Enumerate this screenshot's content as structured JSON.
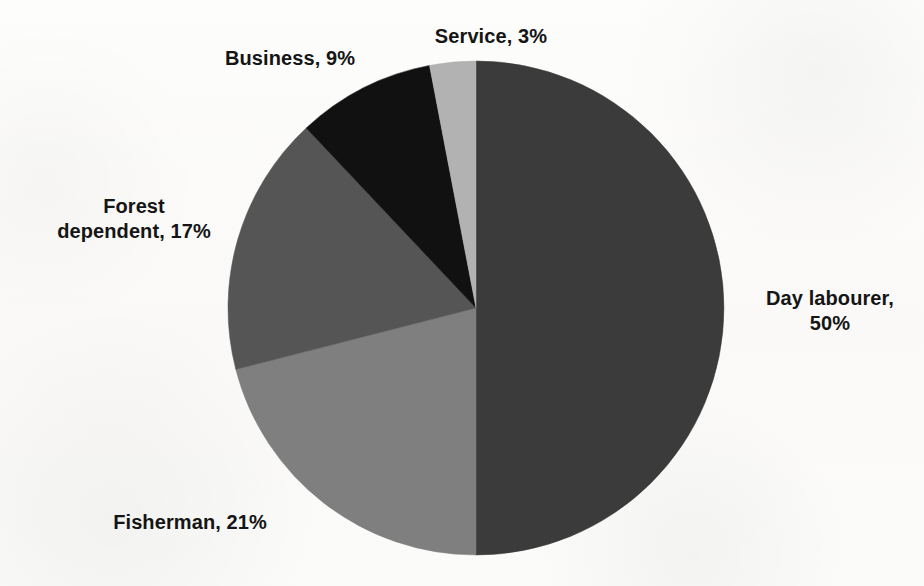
{
  "figure": {
    "background_color": "#fcfcfb",
    "geometry": {
      "center_x": 476,
      "center_y": 308,
      "radius_x": 248,
      "radius_y": 247
    }
  },
  "chart_data": {
    "type": "pie",
    "title": "",
    "subtitle": "",
    "xlabel": "",
    "ylabel": "",
    "grid": false,
    "legend_position": "none",
    "label_format": "{name}, {value}%",
    "start_angle_deg": 0,
    "direction": "clockwise",
    "categories": [
      "Day labourer",
      "Fisherman",
      "Forest dependent",
      "Business",
      "Service"
    ],
    "values": [
      50,
      21,
      17,
      9,
      3
    ],
    "total": 100,
    "units": "percent",
    "colors": [
      "#3b3b3b",
      "#7f7f7f",
      "#555555",
      "#111111",
      "#b2b2b2"
    ],
    "slices": [
      {
        "name": "Day labourer",
        "value": 50,
        "label": "Day labourer,\n50%",
        "color": "#3b3b3b",
        "start_deg": 0,
        "end_deg": 180
      },
      {
        "name": "Fisherman",
        "value": 21,
        "label": "Fisherman, 21%",
        "color": "#7f7f7f",
        "start_deg": 180,
        "end_deg": 255.6
      },
      {
        "name": "Forest dependent",
        "value": 17,
        "label": "Forest\ndependent, 17%",
        "color": "#555555",
        "start_deg": 255.6,
        "end_deg": 316.8
      },
      {
        "name": "Business",
        "value": 9,
        "label": "Business, 9%",
        "color": "#111111",
        "start_deg": 316.8,
        "end_deg": 349.2
      },
      {
        "name": "Service",
        "value": 3,
        "label": "Service, 3%",
        "color": "#b2b2b2",
        "start_deg": 349.2,
        "end_deg": 360
      }
    ]
  },
  "labels": {
    "service": "Service, 3%",
    "business": "Business, 9%",
    "forest_dependent": "Forest\ndependent, 17%",
    "fisherman": "Fisherman, 21%",
    "day_labourer": "Day labourer,\n50%"
  }
}
